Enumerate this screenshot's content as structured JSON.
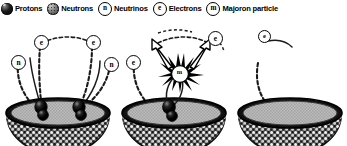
{
  "figure": {
    "type": "diagram",
    "panel_count": 3,
    "background_color": "#ffffff",
    "ink_color": "#000000"
  },
  "legend": {
    "items": [
      {
        "key": "protons",
        "label": "Protons",
        "icon": "filled-black-sphere-icon",
        "glyph": "",
        "style": "sphere-dark"
      },
      {
        "key": "neutrons",
        "label": "Neutrons",
        "icon": "stippled-gray-sphere-icon",
        "glyph": "",
        "style": "sphere-textured"
      },
      {
        "key": "neutrinos",
        "label": "Neutrinos",
        "icon": "circle-n-icon",
        "glyph": "n",
        "style": "outline-circle"
      },
      {
        "key": "electrons",
        "label": "Electrons",
        "icon": "circle-e-icon",
        "glyph": "e",
        "style": "outline-circle"
      },
      {
        "key": "majoron",
        "label": "Majoron particle",
        "icon": "circle-m-icon",
        "glyph": "m",
        "style": "outline-circle"
      }
    ]
  },
  "panels": [
    {
      "id": "panel-1",
      "name": "two-neutrino-double-beta-decay",
      "bowl": {
        "label": "nucleus-bowl",
        "fill": "#b4b4b4",
        "shell": "nucleon-stipple"
      },
      "emitted_particles": [
        {
          "glyph": "n",
          "type": "neutrino",
          "track": "dashed"
        },
        {
          "glyph": "e",
          "type": "electron",
          "track": "solid"
        },
        {
          "glyph": "e",
          "type": "electron",
          "track": "solid"
        },
        {
          "glyph": "n",
          "type": "neutrino",
          "track": "dashed"
        }
      ],
      "nucleon_pairs": 2
    },
    {
      "id": "panel-2",
      "name": "neutrinoless-double-beta-decay-with-majoron",
      "bowl": {
        "label": "nucleus-bowl",
        "fill": "#b4b4b4",
        "shell": "nucleon-stipple"
      },
      "burst": {
        "label": "annihilation-starburst",
        "glyph": "m",
        "type": "majoron"
      },
      "emitted_particles": [
        {
          "glyph": "e",
          "type": "electron",
          "track": "arrow"
        },
        {
          "glyph": "e",
          "type": "electron",
          "track": "arrow"
        }
      ],
      "nucleon_pairs": 1
    },
    {
      "id": "panel-3",
      "name": "third-stage-partial-view",
      "bowl": {
        "label": "nucleus-bowl",
        "fill": "#b4b4b4",
        "shell": "nucleon-stipple"
      },
      "emitted_particles": [
        {
          "glyph": "e",
          "type": "electron",
          "track": "dashed"
        }
      ],
      "clipped": "right-edge"
    }
  ]
}
